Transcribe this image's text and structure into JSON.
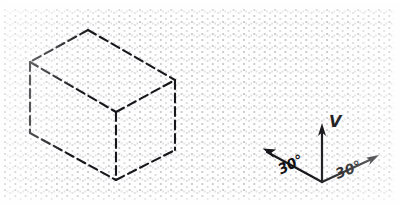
{
  "figure": {
    "background_color": "#fefefe",
    "ink_color": "#17171b",
    "grid": {
      "name": "isometric-dot-paper",
      "dot_color": "#787882"
    }
  },
  "box": {
    "name": "isometric-box",
    "line_style": "dashed",
    "vertices": {
      "top_rear": [
        88,
        30
      ],
      "top_left": [
        30,
        62
      ],
      "top_right": [
        175,
        80
      ],
      "top_front": [
        116,
        112
      ],
      "bottom_left": [
        30,
        133
      ],
      "bottom_right": [
        175,
        150
      ],
      "bottom_front": [
        116,
        180
      ]
    }
  },
  "axes": {
    "name": "isometric-axis-triad",
    "origin": [
      322,
      182
    ],
    "vertical": {
      "label": "V",
      "tip": [
        322,
        125
      ]
    },
    "left_axis": {
      "label": "30°",
      "tip": [
        264,
        150
      ]
    },
    "right_axis": {
      "label": "30°",
      "tip": [
        378,
        157
      ]
    }
  }
}
